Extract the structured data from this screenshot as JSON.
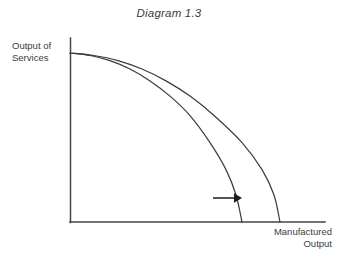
{
  "title": "Diagram 1.3",
  "axes": {
    "y_label_line1": "Output of",
    "y_label_line2": "Services",
    "x_label_line1": "Manufactured",
    "x_label_line2": "Output"
  },
  "colors": {
    "background": "#ffffff",
    "text": "#3c3c3c",
    "axis": "#444444",
    "curve": "#3a3a3a",
    "arrow": "#1d1d1d"
  },
  "chart_data": {
    "type": "line",
    "title": "Diagram 1.3",
    "xlabel": "Manufactured Output",
    "ylabel": "Output of Services",
    "grid": false,
    "legend": null,
    "xlim": [
      0,
      1
    ],
    "ylim": [
      0,
      1
    ],
    "annotations": [
      {
        "name": "outward-shift-arrow",
        "type": "arrow",
        "direction": "right",
        "from": [
          0.72,
          0.14
        ],
        "to": [
          0.92,
          0.14
        ],
        "label": ""
      }
    ],
    "series": [
      {
        "name": "Original production possibility frontier",
        "type": "curve",
        "x": [
          0.0,
          0.1,
          0.2,
          0.3,
          0.4,
          0.5,
          0.6,
          0.7,
          0.78,
          0.83,
          0.86
        ],
        "y": [
          1.0,
          0.985,
          0.955,
          0.905,
          0.835,
          0.745,
          0.63,
          0.47,
          0.31,
          0.16,
          0.0
        ]
      },
      {
        "name": "Shifted production possibility frontier",
        "type": "curve",
        "x": [
          0.0,
          0.12,
          0.24,
          0.36,
          0.48,
          0.6,
          0.72,
          0.86,
          0.96,
          1.02,
          1.05
        ],
        "y": [
          1.0,
          0.985,
          0.955,
          0.905,
          0.835,
          0.745,
          0.63,
          0.47,
          0.31,
          0.16,
          0.0
        ]
      }
    ]
  }
}
